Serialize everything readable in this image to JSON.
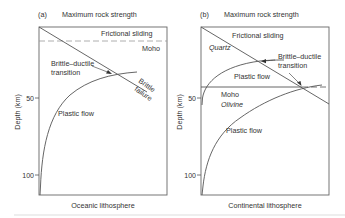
{
  "figure": {
    "panels": [
      {
        "id": "a",
        "tag": "(a)",
        "title": "Maximum rock strength",
        "xlabel": "Oceanic lithosphere",
        "ylabel": "Depth (km)",
        "y_ticks": [
          "50",
          "100"
        ],
        "labels": {
          "frictional": "Frictional sliding",
          "moho": "Moho",
          "bdt_line1": "Brittle–ductile",
          "bdt_line2": "transition",
          "brittle1": "Brittle",
          "brittle2": "failure",
          "plastic": "Plastic flow"
        },
        "moho_style": "dashed"
      },
      {
        "id": "b",
        "tag": "(b)",
        "title": "Maximum rock strength",
        "xlabel": "Continental lithosphere",
        "ylabel": "Depth (km)",
        "y_ticks": [
          "50",
          "100"
        ],
        "labels": {
          "frictional": "Frictional sliding",
          "quartz": "Quartz",
          "bdt_line1": "Brittle–ductile",
          "bdt_line2": "transition",
          "plastic_upper": "Plastic flow",
          "moho": "Moho",
          "olivine": "Olivine",
          "plastic_lower": "Plastic flow"
        },
        "moho_style": "solid"
      }
    ],
    "colors": {
      "line": "#555555",
      "dash": "#999999",
      "text": "#333333",
      "rule": "#dddddd"
    }
  }
}
